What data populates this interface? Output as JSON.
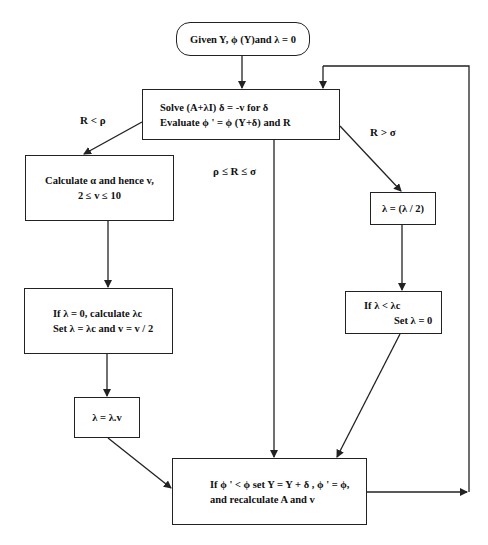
{
  "diagram": {
    "type": "flowchart",
    "nodes": {
      "start": {
        "lines": [
          "Given Y, ϕ (Y)and λ = 0"
        ]
      },
      "solve": {
        "lines": [
          "Solve (A+λI) δ = -v  for δ",
          "Evaluate  ϕ ' = ϕ (Y+δ) and R"
        ]
      },
      "calc_alpha": {
        "lines": [
          "Calculate α and hence v,",
          "2 ≤ v ≤ 10"
        ]
      },
      "halve_lambda": {
        "lines": [
          "λ = (λ / 2)"
        ]
      },
      "lambda_zero": {
        "lines": [
          "If λ = 0, calculate λc",
          "Set λ = λc and v = v / 2"
        ]
      },
      "lambda_less": {
        "lines": [
          "If λ < λc",
          "Set λ = 0"
        ]
      },
      "lambda_times": {
        "lines": [
          "λ = λ.v"
        ]
      },
      "update": {
        "lines": [
          "If ϕ ' < ϕ set Y = Y + δ , ϕ ' = ϕ,",
          "and recalculate A and v"
        ]
      }
    },
    "edge_labels": {
      "r_less_rho": "R < ρ",
      "rho_le_r_le_sigma": "ρ ≤ R ≤ σ",
      "r_greater_sigma": "R > σ"
    },
    "edges": [
      {
        "from": "start",
        "to": "solve"
      },
      {
        "from": "solve",
        "to": "calc_alpha",
        "label": "R < ρ"
      },
      {
        "from": "solve",
        "to": "update",
        "label": "ρ ≤ R ≤ σ"
      },
      {
        "from": "solve",
        "to": "halve_lambda",
        "label": "R > σ"
      },
      {
        "from": "calc_alpha",
        "to": "lambda_zero"
      },
      {
        "from": "lambda_zero",
        "to": "lambda_times"
      },
      {
        "from": "lambda_times",
        "to": "update"
      },
      {
        "from": "halve_lambda",
        "to": "lambda_less"
      },
      {
        "from": "lambda_less",
        "to": "update"
      },
      {
        "from": "update",
        "to": "solve",
        "label": ""
      }
    ]
  }
}
